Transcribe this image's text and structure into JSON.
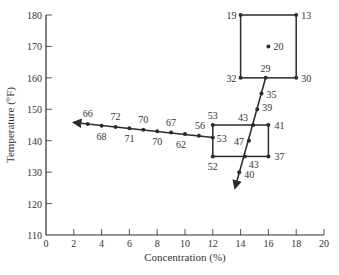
{
  "chart_data": {
    "type": "scatter",
    "title": "",
    "xlabel": "Concentration (%)",
    "ylabel": "Temperature (°F)",
    "xlim": [
      0,
      20
    ],
    "ylim": [
      110,
      180
    ],
    "xticks": [
      0,
      2,
      4,
      6,
      8,
      10,
      12,
      14,
      16,
      18,
      20
    ],
    "yticks": [
      110,
      120,
      130,
      140,
      150,
      160,
      170,
      180
    ],
    "grid": false,
    "legend": null,
    "annotations": "Point values are response labels plotted at each design point; arrows show path of steepest ascent/descent",
    "series": [
      {
        "name": "first-design-square",
        "shape": "square",
        "points": [
          {
            "x": 14,
            "y": 180,
            "label": "19"
          },
          {
            "x": 18,
            "y": 180,
            "label": "13"
          },
          {
            "x": 16,
            "y": 170,
            "label": "20"
          },
          {
            "x": 14,
            "y": 160,
            "label": "32"
          },
          {
            "x": 18,
            "y": 160,
            "label": "30"
          }
        ]
      },
      {
        "name": "steepest-path-down",
        "shape": "arrow-line",
        "points": [
          {
            "x": 15.8,
            "y": 160,
            "label": "29"
          },
          {
            "x": 15.5,
            "y": 155,
            "label": "35"
          },
          {
            "x": 15.2,
            "y": 150,
            "label": "39"
          },
          {
            "x": 14.9,
            "y": 145,
            "label": "43"
          },
          {
            "x": 14.6,
            "y": 140,
            "label": "47"
          },
          {
            "x": 14.3,
            "y": 135,
            "label": "43"
          },
          {
            "x": 13.9,
            "y": 130,
            "label": "40"
          }
        ],
        "arrow_end": {
          "x": 13.6,
          "y": 125
        }
      },
      {
        "name": "second-design-rect",
        "shape": "rectangle",
        "points": [
          {
            "x": 12,
            "y": 145,
            "label": "53"
          },
          {
            "x": 16,
            "y": 145,
            "label": "41"
          },
          {
            "x": 12,
            "y": 141,
            "label": "53"
          },
          {
            "x": 12,
            "y": 135,
            "label": "52"
          },
          {
            "x": 16,
            "y": 135,
            "label": "37"
          }
        ]
      },
      {
        "name": "steepest-path-left",
        "shape": "arrow-line",
        "points": [
          {
            "x": 3,
            "y": 145.3,
            "label": "66"
          },
          {
            "x": 4,
            "y": 144.8,
            "label": "68"
          },
          {
            "x": 5,
            "y": 144.4,
            "label": "72"
          },
          {
            "x": 6,
            "y": 144.0,
            "label": "71"
          },
          {
            "x": 7,
            "y": 143.5,
            "label": "70"
          },
          {
            "x": 8,
            "y": 143.0,
            "label": "70"
          },
          {
            "x": 9,
            "y": 142.6,
            "label": "67"
          },
          {
            "x": 10,
            "y": 142.1,
            "label": "62"
          },
          {
            "x": 11,
            "y": 141.6,
            "label": "56"
          }
        ],
        "arrow_end": {
          "x": 2,
          "y": 145.8
        }
      }
    ]
  },
  "axes": {
    "xlabel": "Concentration (%)",
    "ylabel": "Temperature (°F)",
    "xticks": [
      "0",
      "2",
      "4",
      "6",
      "8",
      "10",
      "12",
      "14",
      "16",
      "18",
      "20"
    ],
    "yticks": [
      "110",
      "120",
      "130",
      "140",
      "150",
      "160",
      "170",
      "180"
    ]
  },
  "colors": {
    "line": "#2b2b2b",
    "text": "#333333",
    "background": "#ffffff"
  }
}
